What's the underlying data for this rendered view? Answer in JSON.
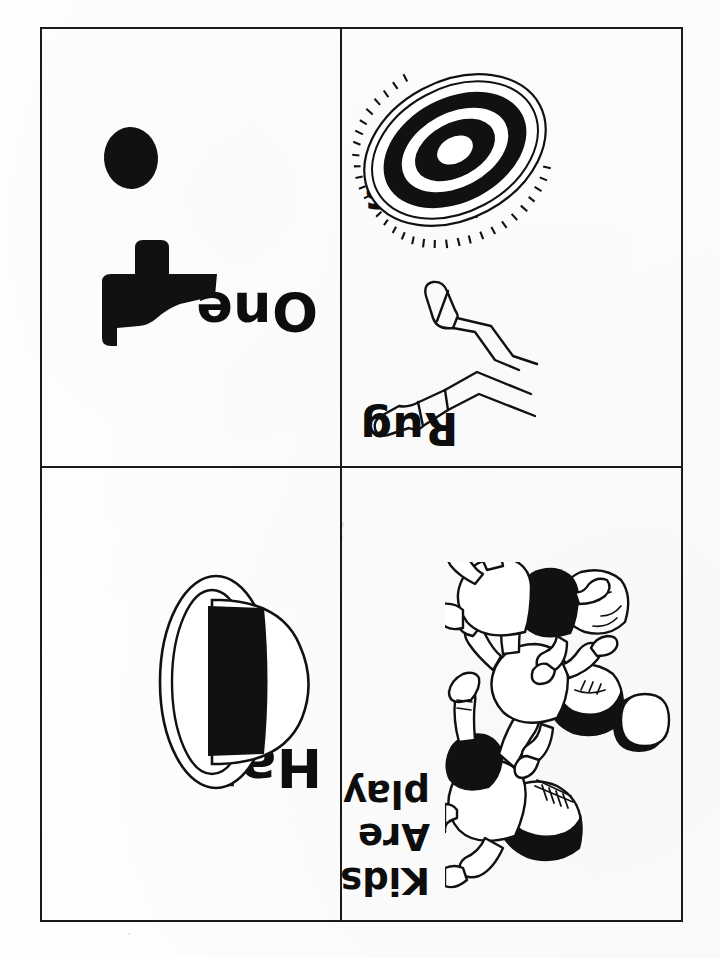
{
  "document": {
    "type": "flashcard-worksheet-scan",
    "orientation_note": "upside-down",
    "page_background": "#fefefe",
    "ink_color": "#111111",
    "border_color": "#1a1a1a"
  },
  "cards": [
    {
      "id": "card-one",
      "position": "top-left",
      "word": "One",
      "illustration": "one-numeral-and-dot"
    },
    {
      "id": "card-rug-legs",
      "position": "top-right",
      "word": "Rug",
      "word_secondary": "Legs",
      "illustration": "oval-target-rug",
      "illustration_secondary": "pair-of-legs"
    },
    {
      "id": "card-hat",
      "position": "bottom-left",
      "word": "Hat",
      "illustration": "hat-with-black-band"
    },
    {
      "id": "card-kids",
      "position": "bottom-right",
      "sentence": "Kids are playing.",
      "sentence_lines": [
        "Kids",
        "Are",
        "playing."
      ],
      "illustration": "three-kids-playing-with-ball"
    }
  ],
  "icons": {
    "rug": "rug-icon",
    "legs": "legs-icon",
    "hat": "hat-icon",
    "kids": "kids-playing-icon",
    "dot": "dot-icon",
    "numeral_one": "numeral-one-icon"
  }
}
